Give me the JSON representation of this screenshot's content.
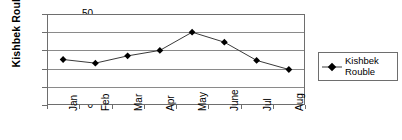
{
  "chart_data": {
    "type": "line",
    "title": "",
    "xlabel": "",
    "ylabel": "Kishbek Rouble",
    "categories": [
      "Jan",
      "Feb",
      "Mar",
      "Apr",
      "May",
      "June",
      "Jul",
      "Aug"
    ],
    "values": [
      25,
      23,
      27,
      30,
      40,
      34.5,
      24.5,
      19.5
    ],
    "series": [
      {
        "name": "Kishbek Rouble",
        "values": [
          25,
          23,
          27,
          30,
          40,
          34.5,
          24.5,
          19.5
        ]
      }
    ],
    "ylim": [
      0,
      50
    ],
    "yticks": [
      0,
      10,
      20,
      30,
      40,
      50
    ],
    "ytick_labels": [
      "0",
      "10",
      "20",
      "30",
      "40",
      "50"
    ],
    "grid": true,
    "grid_axis": "y",
    "legend_position": "right",
    "marker": "diamond",
    "marker_color": "#000000",
    "line_color": "#3a3a3a",
    "axis_color": "#6e6e6e",
    "grid_color": "#8a8a8a",
    "background": "#ffffff",
    "xtick_rotation": -90
  },
  "legend": {
    "entries": [
      {
        "label_line1": "Kishbek",
        "label_line2": "Rouble",
        "marker": "diamond-marker"
      }
    ]
  },
  "axes": {
    "y_title": "Kishbek Rouble"
  }
}
